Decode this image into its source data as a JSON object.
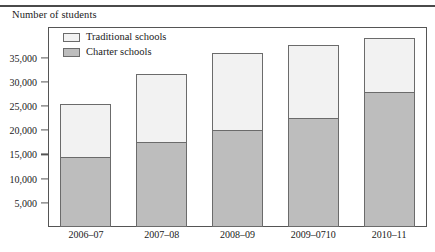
{
  "chart_data": {
    "type": "bar",
    "subtype": "stacked-vertical",
    "title": "Number of students",
    "ylabel": "Number of students",
    "xlabel": "",
    "categories": [
      "2006–07",
      "2007–08",
      "2008–09",
      "2009–0710",
      "2010–11"
    ],
    "series": [
      {
        "name": "Charter schools",
        "color": "#bdbdbd",
        "values": [
          14500,
          17500,
          20000,
          22500,
          28000
        ]
      },
      {
        "name": "Traditional schools",
        "color": "#f2f2f2",
        "values": [
          11000,
          14000,
          16000,
          15000,
          11000
        ]
      }
    ],
    "totals": [
      25500,
      31500,
      36000,
      37500,
      39000
    ],
    "ylim": [
      0,
      41300
    ],
    "yticks": [
      5000,
      10000,
      15000,
      20000,
      25000,
      30000,
      35000
    ],
    "ytick_labels": [
      "5,000",
      "10,000",
      "15,000",
      "20,000",
      "25,000",
      "30,000",
      "35,000"
    ],
    "grid": false,
    "legend_position": "top-left",
    "stack_order_bottom_to_top": [
      "Charter schools",
      "Traditional schools"
    ]
  },
  "legend": {
    "items": [
      {
        "label": "Traditional schools",
        "swatch": "#f2f2f2"
      },
      {
        "label": "Charter schools",
        "swatch": "#bdbdbd"
      }
    ]
  },
  "colors": {
    "traditional": "#f2f2f2",
    "charter": "#bdbdbd",
    "outline": "#6b6b6b",
    "frame": "#555555",
    "rule": "#4a4a4a",
    "text": "#1a1a1a"
  }
}
